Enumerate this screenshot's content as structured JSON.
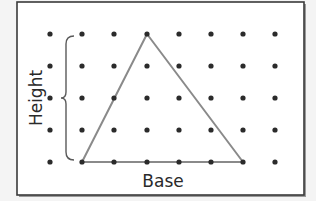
{
  "figure": {
    "type": "dot-grid-triangle",
    "colors": {
      "background": "#f4f4f4",
      "panel": "#ffffff",
      "frame": "#3a3a3a",
      "dot": "#2b2b2b",
      "triangle": "#8a8a8a",
      "label": "#2a2a2a"
    },
    "grid": {
      "columns": 8,
      "rows": 5,
      "x": [
        50,
        82,
        114,
        147,
        179,
        211,
        243,
        275
      ],
      "y": [
        34,
        66,
        98,
        130,
        162
      ]
    },
    "triangle": {
      "vertices": [
        [
          82,
          162
        ],
        [
          147,
          34
        ],
        [
          243,
          162
        ]
      ]
    },
    "labels": {
      "base": "Base",
      "height": "Height"
    }
  }
}
